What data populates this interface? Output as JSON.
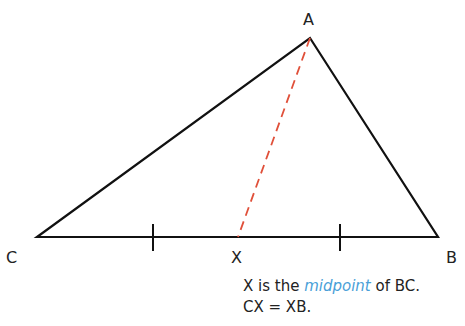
{
  "diagram": {
    "vertices": {
      "A": {
        "label": "A",
        "x": 310,
        "y": 38
      },
      "B": {
        "label": "B",
        "x": 438,
        "y": 237
      },
      "C": {
        "label": "C",
        "x": 37,
        "y": 237
      },
      "X": {
        "label": "X",
        "x": 238,
        "y": 237
      }
    },
    "median_color": "#e0503a",
    "line_color": "#111111",
    "tick_marks": [
      153,
      340
    ]
  },
  "caption": {
    "line1_pre": "X is the ",
    "line1_highlight": "midpoint",
    "line1_post": " of BC.",
    "line2": "CX = XB."
  },
  "colors": {
    "highlight": "#4a9fd8"
  }
}
